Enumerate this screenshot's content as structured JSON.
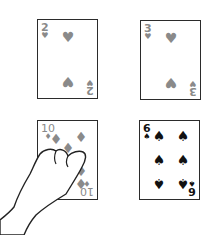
{
  "colors": {
    "red_suit": "#8a8a8a",
    "black_suit": "#111111",
    "card_border": "#2b2b2b"
  },
  "cards": [
    {
      "rank": "2",
      "suit": "♥",
      "suit_name": "hearts",
      "color": "red"
    },
    {
      "rank": "3",
      "suit": "♥",
      "suit_name": "hearts",
      "color": "red"
    },
    {
      "rank": "10",
      "suit": "♦",
      "suit_name": "diamonds",
      "color": "red"
    },
    {
      "rank": "6",
      "suit": "♠",
      "suit_name": "spades",
      "color": "black"
    }
  ],
  "pointer": {
    "icon": "pointing-hand-icon",
    "target_card": "10♦"
  }
}
